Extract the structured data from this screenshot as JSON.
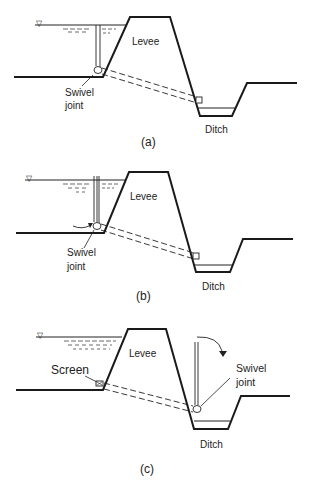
{
  "figure": {
    "panels": [
      {
        "id": "a",
        "caption": "(a)",
        "labels": {
          "levee": "Levee",
          "swivel_line1": "Swivel",
          "swivel_line2": "joint",
          "ditch": "Ditch"
        }
      },
      {
        "id": "b",
        "caption": "(b)",
        "labels": {
          "levee": "Levee",
          "swivel_line1": "Swivel",
          "swivel_line2": "joint",
          "ditch": "Ditch"
        }
      },
      {
        "id": "c",
        "caption": "(c)",
        "labels": {
          "levee": "Levee",
          "screen": "Screen",
          "swivel_line1": "Swivel",
          "swivel_line2": "joint",
          "ditch": "Ditch"
        }
      }
    ],
    "symbols": {
      "water_level": "▽"
    },
    "colors": {
      "line": "#1a1a1a",
      "background": "#ffffff"
    }
  }
}
